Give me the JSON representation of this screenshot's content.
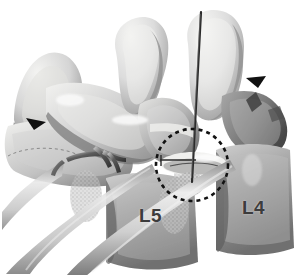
{
  "figure": {
    "kind": "medical-illustration",
    "modality": "grayscale anatomical rendering",
    "width": 296,
    "height": 275,
    "background_color": "#ffffff"
  },
  "labels": {
    "l5": "L5",
    "l4": "L4",
    "label_color": "#3c3c3c"
  },
  "annotations": {
    "highlight_circle": {
      "name": "dashed-target-circle",
      "shape": "circle",
      "cx": 192,
      "cy": 165,
      "r": 36,
      "stroke_color": "#121212",
      "stroke_width": 2.6,
      "dash_pattern": "4 4"
    },
    "needle": {
      "name": "needle-probe",
      "x1": 201,
      "y1": 12,
      "x2": 192,
      "y2": 182,
      "stroke_color": "#2b2b2b",
      "stroke_width": 2.2
    },
    "marker_line": {
      "name": "horizontal-marker-line",
      "x1": 160,
      "y1": 160,
      "x2": 196,
      "y2": 160,
      "stroke_color": "#2a2a2a",
      "stroke_width": 1.4
    }
  },
  "palette": {
    "bone_highlight": "#f0f0ee",
    "bone_light": "#dedede",
    "bone_mid": "#b5b5b5",
    "bone_shade": "#8d8d8d",
    "bone_dark": "#636363",
    "bone_deep": "#3f3f3f",
    "cavity_black": "#1a1a1a",
    "tube_light": "#e2e2e2",
    "tube_mid": "#a9a9a9",
    "tube_dark": "#6e6e6e",
    "hardware_metal": "#4a4a4a",
    "background": "#ffffff"
  },
  "structures": [
    {
      "name": "spinous-process-left",
      "description": "upper-left bone prominence"
    },
    {
      "name": "spinous-process-middle",
      "description": "tall central spinous process"
    },
    {
      "name": "spinous-process-right",
      "description": "tall right spinous process behind needle"
    },
    {
      "name": "facet-joint-l4-l5",
      "description": "articulating facet within dashed circle"
    },
    {
      "name": "vertebral-body-l5",
      "description": "lower-left vertebral body"
    },
    {
      "name": "vertebral-body-l4",
      "description": "lower-right vertebral body"
    },
    {
      "name": "nerve-root-tube",
      "description": "pale tube exiting toward lower-left"
    },
    {
      "name": "surgical-clips",
      "description": "metallic retractor clips mid-left"
    },
    {
      "name": "cancellous-bone-texture",
      "description": "trabecular stippled region"
    }
  ]
}
